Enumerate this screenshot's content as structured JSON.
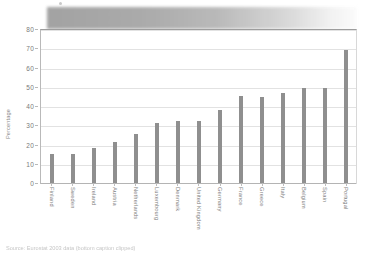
{
  "banner": {
    "label": "redacted-title-banner",
    "accent": "#9b9b9b"
  },
  "axis": {
    "y_title": "Percentage",
    "y_ticks": [
      "0",
      "10",
      "20",
      "30",
      "40",
      "50",
      "60",
      "70",
      "80"
    ]
  },
  "caption": {
    "text": "Source: Eurostat 2003 data (bottom caption clipped)"
  },
  "colors": {
    "bar": "#8f8f8f",
    "grid": "#e2e2e2",
    "axis": "#b4b4b4",
    "text": "#7d7d7d"
  },
  "chart_data": {
    "type": "bar",
    "title": "",
    "xlabel": "",
    "ylabel": "Percentage",
    "ylim": [
      0,
      80
    ],
    "ytick_step": 10,
    "grid": true,
    "legend": "none",
    "categories": [
      "Finland",
      "Sweden",
      "Ireland",
      "Austria",
      "Netherlands",
      "Luxembourg",
      "Denmark",
      "United Kingdom",
      "Germany",
      "France",
      "Greece",
      "Italy",
      "Belgium",
      "Spain",
      "Portugal"
    ],
    "values": [
      15,
      15,
      18,
      21.5,
      25.5,
      31,
      32,
      32,
      38,
      45,
      44.5,
      47,
      49.5,
      49.5,
      69
    ]
  }
}
